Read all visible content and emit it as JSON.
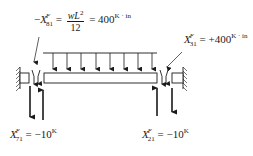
{
  "diagram": {
    "type": "fixed-end beam with uniform distributed load",
    "labels": {
      "top_left_moment": {
        "prefix": "−",
        "symbol": "X",
        "superscript": "F",
        "subscript": "81",
        "eq1": "=",
        "fraction_numerator_w": "w",
        "fraction_numerator_L": "L",
        "fraction_numerator_exp": "2",
        "fraction_denominator": "12",
        "eq2": "=",
        "value": "400",
        "unit": "K · in"
      },
      "top_right_moment": {
        "symbol": "X",
        "superscript": "F",
        "subscript": "31",
        "eq": "=",
        "value": "+400",
        "unit": "K · in"
      },
      "bottom_left_force": {
        "symbol": "X",
        "superscript": "F",
        "subscript": "71",
        "eq": "=",
        "value": "−10",
        "unit": "K"
      },
      "bottom_right_force": {
        "symbol": "X",
        "superscript": "F",
        "subscript": "21",
        "eq": "=",
        "value": "−10",
        "unit": "K"
      }
    },
    "load_arrow_count": 8,
    "colors": {
      "ink": "#1a1a1a",
      "background": "#ffffff"
    }
  }
}
